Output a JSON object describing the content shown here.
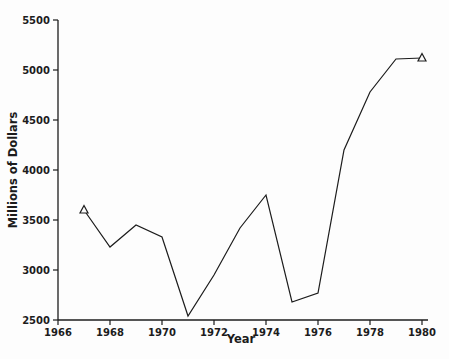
{
  "page": {
    "background": "#fdfdfd"
  },
  "chart_data": {
    "type": "line",
    "title": "",
    "xlabel": "Year",
    "ylabel": "Millions of Dollars",
    "xlim": [
      1966,
      1980
    ],
    "ylim": [
      2500,
      5500
    ],
    "xticks": [
      1966,
      1968,
      1970,
      1972,
      1974,
      1976,
      1978,
      1980
    ],
    "yticks": [
      2500,
      3000,
      3500,
      4000,
      4500,
      5000,
      5500
    ],
    "grid": false,
    "legend_position": "none",
    "line_color": "#1c1c1c",
    "axis_color": "#1c1c1c",
    "marker": "open-triangle",
    "marker_points": [
      1967,
      1980
    ],
    "series": [
      {
        "name": "Millions of Dollars",
        "x": [
          1967,
          1968,
          1969,
          1970,
          1971,
          1972,
          1973,
          1974,
          1975,
          1976,
          1977,
          1978,
          1979,
          1980
        ],
        "values": [
          3600,
          3230,
          3450,
          3330,
          2540,
          2950,
          3420,
          3750,
          2680,
          2770,
          4200,
          4780,
          5110,
          5120
        ]
      }
    ]
  }
}
